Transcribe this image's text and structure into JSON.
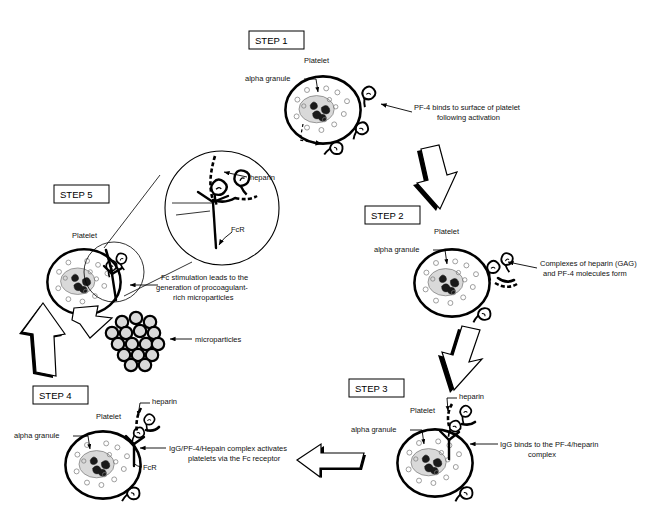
{
  "figure": {
    "title_present": false,
    "background_color": "#ffffff",
    "ink_color": "#000000",
    "granule_fill": "#d9d9d9",
    "microparticle_fill": "#d9d9d9"
  },
  "steps": [
    {
      "id": "step1",
      "badge": "STEP 1",
      "cell_label": "Platelet",
      "granule_label": "alpha granule",
      "callout": "PF-4 binds to surface of platelet\nfollowing activation",
      "callout_line1": "PF-4 binds to surface of platelet",
      "callout_line2": "following activation",
      "extra_labels": []
    },
    {
      "id": "step2",
      "badge": "STEP 2",
      "cell_label": "Platelet",
      "granule_label": "alpha granule",
      "callout_line1": "Complexes of heparin (GAG)",
      "callout_line2": "and PF-4 molecules form",
      "extra_labels": []
    },
    {
      "id": "step3",
      "badge": "STEP 3",
      "cell_label": "Platelet",
      "granule_label": "alpha granule",
      "callout_line1": "IgG binds to the PF-4/heparin",
      "callout_line2": "complex",
      "extra_labels": [
        "heparin"
      ]
    },
    {
      "id": "step4",
      "badge": "STEP 4",
      "cell_label": "Platelet",
      "granule_label": "alpha granule",
      "callout_line1": "IgG/PF-4/Hepain complex activates",
      "callout_line2": "platelets via the Fc receptor",
      "extra_labels": [
        "heparin",
        "FcR"
      ]
    },
    {
      "id": "step5",
      "badge": "STEP 5",
      "cell_label": "Platelet",
      "granule_label": "",
      "callout_line1": "Fc stimulation leads to the",
      "callout_line2": "generation of procoagulant-",
      "callout_line3": "rich microparticles",
      "microparticle_label": "microparticles",
      "inset_labels": [
        "heparin",
        "FcR"
      ]
    }
  ],
  "flow_arrows": [
    {
      "name": "arrow-step1-to-step2",
      "direction": "down-right"
    },
    {
      "name": "arrow-step2-to-step3",
      "direction": "down-left"
    },
    {
      "name": "arrow-step3-to-step4",
      "direction": "left"
    },
    {
      "name": "arrow-step4-to-step5",
      "direction": "up"
    }
  ]
}
